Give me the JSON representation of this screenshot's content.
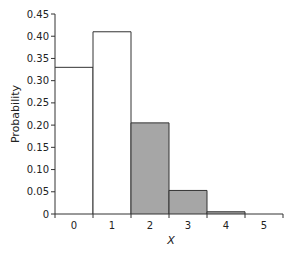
{
  "chart_data": {
    "type": "bar",
    "title": "",
    "xlabel": "X",
    "ylabel": "Probability",
    "categories": [
      "0",
      "1",
      "2",
      "3",
      "4",
      "5"
    ],
    "values": [
      0.33,
      0.41,
      0.205,
      0.053,
      0.005,
      0.0
    ],
    "shaded": [
      false,
      false,
      true,
      true,
      true,
      true
    ],
    "ylim": [
      0,
      0.45
    ],
    "yticks": [
      "0",
      "0.05",
      "0.10",
      "0.15",
      "0.20",
      "0.25",
      "0.30",
      "0.35",
      "0.40",
      "0.45"
    ],
    "grid": false,
    "legend": null,
    "colors": {
      "unshaded_fill": "#ffffff",
      "shaded_fill": "#a6a6a6",
      "edge": "#333333",
      "axis": "#333333"
    }
  }
}
